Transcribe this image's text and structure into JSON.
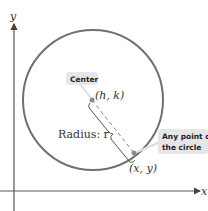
{
  "diagram": {
    "axes": {
      "x_label": "x",
      "y_label": "y"
    },
    "center_point": {
      "label": "(h, k)",
      "callout": "Center"
    },
    "circle_point": {
      "label": "(x, y)",
      "callout_line1": "Any point on",
      "callout_line2": "the circle"
    },
    "radius": {
      "label": "Radius: r"
    },
    "colors": {
      "circle": "#707070",
      "axes": "#555555",
      "callout_bg": "#e6e6e6",
      "point": "#8a8a8a"
    }
  }
}
